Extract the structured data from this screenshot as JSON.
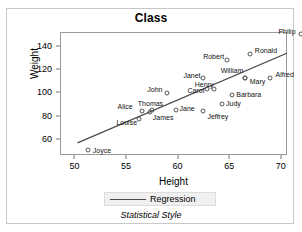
{
  "top_strip": {
    "text": ""
  },
  "chart_data": {
    "type": "scatter",
    "title": "Class",
    "xlabel": "Height",
    "ylabel": "Weight",
    "xlim": [
      48.6,
      70.6
    ],
    "ylim": [
      46,
      152
    ],
    "xticks": [
      50,
      55,
      60,
      65,
      70
    ],
    "yticks": [
      60,
      80,
      100,
      120,
      140
    ],
    "grid": false,
    "legend": {
      "position": "below-axis",
      "entries": [
        "Regression"
      ]
    },
    "footnote": "Statistical Style",
    "point_label_field": "name",
    "points": [
      {
        "name": "Joyce",
        "x": 51.3,
        "y": 50.5,
        "label_dx": 5,
        "label_dy": 1
      },
      {
        "name": "Louise",
        "x": 56.3,
        "y": 77.0,
        "label_dx": -23,
        "label_dy": 4
      },
      {
        "name": "Alice",
        "x": 56.5,
        "y": 84.0,
        "label_dx": -24,
        "label_dy": -4
      },
      {
        "name": "Thomas",
        "x": 57.5,
        "y": 85.0,
        "label_dx": -14,
        "label_dy": -6
      },
      {
        "name": "James",
        "x": 57.3,
        "y": 83.0,
        "label_dx": 3,
        "label_dy": 6
      },
      {
        "name": "John",
        "x": 59.0,
        "y": 99.5,
        "label_dx": -20,
        "label_dy": -3
      },
      {
        "name": "Jane",
        "x": 59.8,
        "y": 84.5,
        "label_dx": 4,
        "label_dy": -1
      },
      {
        "name": "Carol",
        "x": 62.8,
        "y": 102.5,
        "label_dx": -19,
        "label_dy": 2
      },
      {
        "name": "Henry",
        "x": 63.5,
        "y": 102.5,
        "label_dx": -19,
        "label_dy": -4
      },
      {
        "name": "Janet",
        "x": 62.5,
        "y": 112.5,
        "label_dx": -20,
        "label_dy": -2
      },
      {
        "name": "Jeffrey",
        "x": 62.5,
        "y": 84.0,
        "label_dx": 4,
        "label_dy": 6
      },
      {
        "name": "Judy",
        "x": 64.3,
        "y": 90.0,
        "label_dx": 4,
        "label_dy": 0
      },
      {
        "name": "Barbara",
        "x": 65.3,
        "y": 98.0,
        "label_dx": 4,
        "label_dy": 0
      },
      {
        "name": "Robert",
        "x": 64.8,
        "y": 128.0,
        "label_dx": -24,
        "label_dy": -3
      },
      {
        "name": "William",
        "x": 66.5,
        "y": 112.0,
        "label_dx": -24,
        "label_dy": -7
      },
      {
        "name": "Mary",
        "x": 66.5,
        "y": 112.0,
        "label_dx": 5,
        "label_dy": 4
      },
      {
        "name": "Ronald",
        "x": 67.0,
        "y": 133.0,
        "label_dx": 5,
        "label_dy": -3
      },
      {
        "name": "Alfred",
        "x": 69.0,
        "y": 112.5,
        "label_dx": 5,
        "label_dy": -3
      },
      {
        "name": "Philip",
        "x": 72.0,
        "y": 150.0,
        "label_dx": -23,
        "label_dy": -2
      }
    ],
    "regression": {
      "label": "Regression",
      "x_start": 50.3,
      "y_start": 56.5,
      "x_end": 71.7,
      "y_end": 138.0,
      "color": "#4a4a4a"
    }
  },
  "colors": {
    "marker_stroke": "#555555",
    "frame": "#9a9a9a",
    "legend_bg": "#f0f0f0",
    "text": "#111111"
  }
}
